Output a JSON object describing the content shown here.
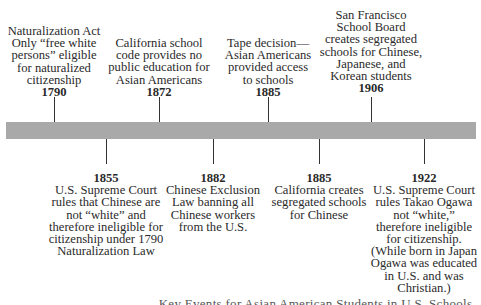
{
  "timeline": {
    "bar_color": "#a9a9a9",
    "events_above": [
      {
        "year": "1790",
        "lines": [
          "Naturalization Act",
          "Only “free white",
          "persons” eligible",
          "for naturalized",
          "citizenship"
        ]
      },
      {
        "year": "1872",
        "lines": [
          "California school",
          "code provides no",
          "public education for",
          "Asian Americans"
        ]
      },
      {
        "year": "1885",
        "lines": [
          "Tape decision—",
          "Asian Americans",
          "provided access",
          "to schools"
        ]
      },
      {
        "year": "1906",
        "lines": [
          "San Francisco",
          "School Board",
          "creates segregated",
          "schools for Chinese,",
          "Japanese, and",
          "Korean students"
        ]
      }
    ],
    "events_below": [
      {
        "year": "1855",
        "lines": [
          "U.S. Supreme Court",
          "rules that Chinese are",
          "not “white” and",
          "therefore ineligible for",
          "citizenship under 1790",
          "Naturalization Law"
        ]
      },
      {
        "year": "1882",
        "lines": [
          "Chinese Exclusion",
          "Law banning all",
          "Chinese workers",
          "from the U.S."
        ]
      },
      {
        "year": "1885",
        "lines": [
          "California creates",
          "segregated schools",
          "for Chinese"
        ]
      },
      {
        "year": "1922",
        "lines": [
          "U.S. Supreme Court",
          "rules Takao Ogawa",
          "not “white,”",
          "therefore ineligible",
          "for citizenship.",
          "(While born in Japan",
          "Ogawa was educated",
          "in U.S. and was",
          "Christian.)"
        ]
      }
    ]
  },
  "caption": "Key Events for Asian American Students in U.S. Schools"
}
